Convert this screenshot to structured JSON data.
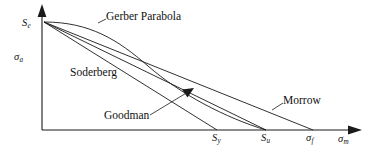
{
  "figure": {
    "type": "engineering-diagram",
    "background_color": "#ffffff",
    "line_color": "#1a1a1a"
  },
  "axes": {
    "y": {
      "label": "σ",
      "label_sub": "a",
      "origin_label": "S",
      "origin_label_sub": "e",
      "arrow": true
    },
    "x": {
      "label": "σ",
      "label_sub": "m",
      "arrow": true,
      "ticks": [
        {
          "label": "S",
          "sub": "y"
        },
        {
          "label": "S",
          "sub": "u"
        },
        {
          "label": "σ",
          "sub": "f"
        }
      ]
    }
  },
  "curves": [
    {
      "name": "soderberg",
      "label": "Soderberg",
      "shape": "line",
      "end_tick": "Sy"
    },
    {
      "name": "goodman",
      "label": "Goodman",
      "shape": "line",
      "end_tick": "Su"
    },
    {
      "name": "gerber",
      "label": "Gerber Parabola",
      "shape": "parabola",
      "end_tick": "Su"
    },
    {
      "name": "morrow",
      "label": "Morrow",
      "shape": "line",
      "end_tick": "sigma_f"
    }
  ],
  "labels": {
    "se": "S",
    "se_sub": "e",
    "sigma_a": "σ",
    "sigma_a_sub": "a",
    "gerber": "Gerber Parabola",
    "soderberg": "Soderberg",
    "goodman": "Goodman",
    "morrow": "Morrow",
    "sy": "S",
    "sy_sub": "y",
    "su": "S",
    "su_sub": "u",
    "sigma_f": "σ",
    "sigma_f_sub": "f",
    "sigma_m": "σ",
    "sigma_m_sub": "m"
  }
}
